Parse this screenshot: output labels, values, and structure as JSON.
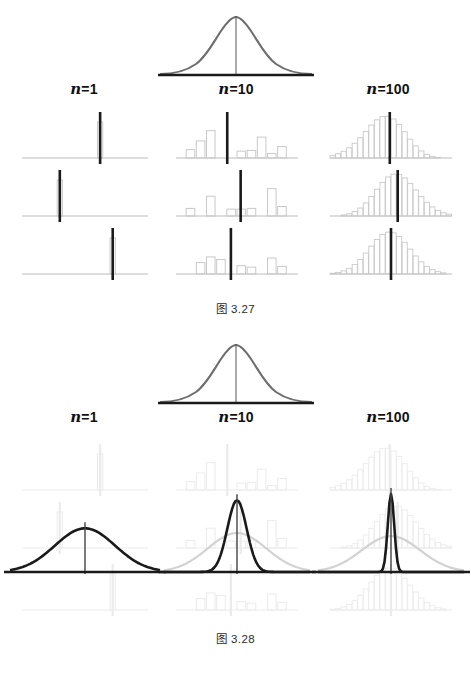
{
  "page": {
    "background": "#ffffff",
    "width": 471,
    "height": 689
  },
  "colors": {
    "dark": "#1a1a1a",
    "mean_line": "#1a1a1a",
    "population_curve": "#6e6e6e",
    "histogram_stroke": "#c9c9c9",
    "histogram_faded": "#dcdcdc",
    "axis": "#bcbcbc",
    "axis_dark": "#1a1a1a",
    "reference_curve": "#d2d2d2",
    "caption": "#2b2b2b"
  },
  "figures": [
    {
      "id": "fig-327",
      "caption": "图 3.27",
      "population": {
        "label": "population-distribution",
        "curve_sigma": 1.0,
        "has_center_line": true,
        "axis_style": "dark"
      },
      "columns": [
        {
          "key": "n1",
          "label_prefix": "n",
          "label_suffix": "=1",
          "label_full": "n=1",
          "sample_size": 1,
          "rows": [
            {
              "bars": [
                1.0
              ],
              "bar_x": [
                0.62
              ],
              "mean_x": 0.62,
              "mean_height": 1.18
            },
            {
              "bars": [
                1.0
              ],
              "bar_x": [
                0.3
              ],
              "mean_x": 0.3,
              "mean_height": 1.18
            },
            {
              "bars": [
                1.0
              ],
              "bar_x": [
                0.72
              ],
              "mean_x": 0.72,
              "mean_height": 1.18
            }
          ]
        },
        {
          "key": "n10",
          "label_prefix": "n",
          "label_suffix": "=10",
          "label_full": "n=10",
          "sample_size": 10,
          "rows": [
            {
              "bars": [
                0.22,
                0.45,
                0.72,
                0.0,
                0.0,
                0.18,
                0.2,
                0.55,
                0.12,
                0.3
              ],
              "mean_x": 0.42,
              "mean_height": 1.18
            },
            {
              "bars": [
                0.2,
                0.0,
                0.52,
                0.0,
                0.18,
                0.18,
                0.2,
                0.0,
                0.72,
                0.25
              ],
              "mean_x": 0.53,
              "mean_height": 1.18
            },
            {
              "bars": [
                0.0,
                0.3,
                0.45,
                0.38,
                0.0,
                0.22,
                0.18,
                0.0,
                0.42,
                0.2
              ],
              "mean_x": 0.45,
              "mean_height": 1.18
            }
          ]
        },
        {
          "key": "n100",
          "label_prefix": "n",
          "label_suffix": "=100",
          "label_full": "n=100",
          "sample_size": 100,
          "rows": [
            {
              "shape": "bell",
              "peak_x": 0.46,
              "spread": 0.165,
              "skew": 0.12,
              "mean_x": 0.49,
              "mean_height": 1.18
            },
            {
              "shape": "bell",
              "peak_x": 0.54,
              "spread": 0.165,
              "skew": -0.06,
              "mean_x": 0.555,
              "mean_height": 1.18
            },
            {
              "shape": "bell",
              "peak_x": 0.49,
              "spread": 0.165,
              "skew": 0.0,
              "mean_x": 0.5,
              "mean_height": 1.18
            }
          ]
        }
      ]
    },
    {
      "id": "fig-328",
      "caption": "图 3.28",
      "population": {
        "label": "population-distribution",
        "curve_sigma": 1.0,
        "has_center_line": true,
        "axis_style": "dark"
      },
      "columns": [
        {
          "key": "n1",
          "label_prefix": "n",
          "label_suffix": "=1",
          "label_full": "n=1",
          "sample_size": 1,
          "sampling_curve": {
            "sigma_ratio": 1.0,
            "peak": 0.56,
            "emphasis": "dark"
          },
          "reference_curve": null,
          "rows": [
            {
              "bars": [
                1.0
              ],
              "bar_x": [
                0.62
              ],
              "mean_x": 0.62
            },
            {
              "bars": [
                1.0
              ],
              "bar_x": [
                0.3
              ],
              "mean_x": 0.3
            },
            {
              "bars": [
                1.0
              ],
              "bar_x": [
                0.72
              ],
              "mean_x": 0.72
            }
          ]
        },
        {
          "key": "n10",
          "label_prefix": "n",
          "label_suffix": "=10",
          "label_full": "n=10",
          "sample_size": 10,
          "sampling_curve": {
            "sigma_ratio": 0.33,
            "peak": 0.92,
            "emphasis": "dark"
          },
          "reference_curve": {
            "sigma_ratio": 1.0,
            "peak": 0.5
          },
          "rows": [
            {
              "bars": [
                0.22,
                0.45,
                0.72,
                0.0,
                0.0,
                0.18,
                0.2,
                0.55,
                0.12,
                0.3
              ],
              "mean_x": 0.42
            },
            {
              "bars": [
                0.2,
                0.0,
                0.52,
                0.0,
                0.18,
                0.18,
                0.2,
                0.0,
                0.72,
                0.25
              ],
              "mean_x": 0.53
            },
            {
              "bars": [
                0.0,
                0.3,
                0.45,
                0.38,
                0.0,
                0.22,
                0.18,
                0.0,
                0.42,
                0.2
              ],
              "mean_x": 0.45
            }
          ]
        },
        {
          "key": "n100",
          "label_prefix": "n",
          "label_suffix": "=100",
          "label_full": "n=100",
          "sample_size": 100,
          "sampling_curve": {
            "sigma_ratio": 0.11,
            "peak": 1.0,
            "emphasis": "dark"
          },
          "reference_curve": {
            "sigma_ratio": 1.0,
            "peak": 0.46
          },
          "rows": [
            {
              "shape": "bell",
              "peak_x": 0.46,
              "spread": 0.165,
              "skew": 0.12,
              "mean_x": 0.49
            },
            {
              "shape": "bell",
              "peak_x": 0.54,
              "spread": 0.165,
              "skew": -0.06,
              "mean_x": 0.555
            },
            {
              "shape": "bell",
              "peak_x": 0.49,
              "spread": 0.165,
              "skew": 0.0,
              "mean_x": 0.5
            }
          ]
        }
      ]
    }
  ],
  "chart_data": {
    "type": "line",
    "subtitle": "Population distribution with sample histograms and sampling distributions for n = 1, 10, 100",
    "xlabel": "",
    "ylabel": "",
    "grid": false,
    "legend": "none",
    "categories": [
      "n=1",
      "n=10",
      "n=100"
    ],
    "series": [
      {
        "name": "population",
        "sigma": 1.0,
        "mean": 0.0,
        "values": [
          1.0,
          1.0,
          1.0
        ]
      },
      {
        "name": "sampling_distribution_sigma",
        "values": [
          1.0,
          0.3162,
          0.1
        ]
      },
      {
        "name": "sampling_distribution_peak_height",
        "values": [
          0.56,
          0.92,
          1.0
        ]
      }
    ],
    "annotations": [
      "图 3.27",
      "图 3.28",
      "n=1",
      "n=10",
      "n=100"
    ]
  }
}
